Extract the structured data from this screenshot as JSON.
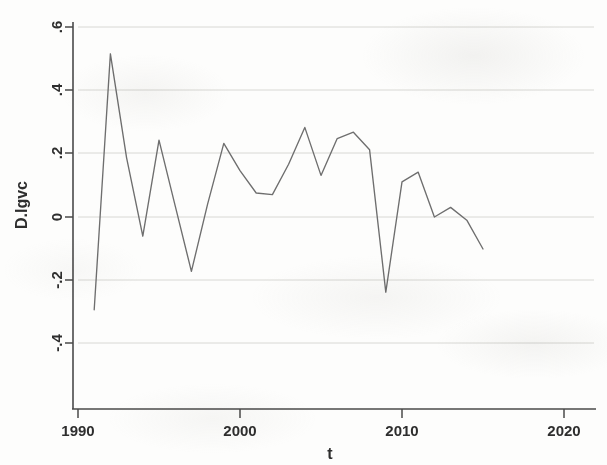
{
  "chart_data": {
    "type": "line",
    "title": "",
    "xlabel": "t",
    "ylabel": "D.lgvc",
    "xlim": [
      1990,
      2020
    ],
    "ylim": [
      -0.4,
      0.6
    ],
    "grid": true,
    "legend": "none",
    "x_ticks": [
      "1990",
      "2000",
      "2010",
      "2020"
    ],
    "x_tick_values": [
      1990,
      2000,
      2010,
      2020
    ],
    "y_ticks": [
      ".6",
      ".4",
      ".2",
      "0",
      "-.2",
      "-.4"
    ],
    "y_tick_values": [
      0.6,
      0.4,
      0.2,
      0,
      -0.2,
      -0.4
    ],
    "series": [
      {
        "name": "D.lgvc",
        "color": "#6e6e6e",
        "x": [
          1991,
          1992,
          1993,
          1994,
          1995,
          1996,
          1997,
          1998,
          1999,
          2000,
          2001,
          2002,
          2003,
          2004,
          2005,
          2006,
          2007,
          2008,
          2009,
          2010,
          2011,
          2012,
          2013,
          2014,
          2015
        ],
        "values": [
          -0.29,
          0.51,
          0.185,
          -0.06,
          0.24,
          0.035,
          -0.17,
          0.04,
          0.23,
          0.145,
          0.075,
          0.07,
          0.165,
          0.28,
          0.13,
          0.245,
          0.265,
          0.21,
          -0.235,
          0.11,
          0.14,
          0.0,
          0.03,
          -0.01,
          -0.1
        ]
      }
    ]
  },
  "axes": {
    "x_title": "t",
    "y_title": "D.lgvc"
  }
}
